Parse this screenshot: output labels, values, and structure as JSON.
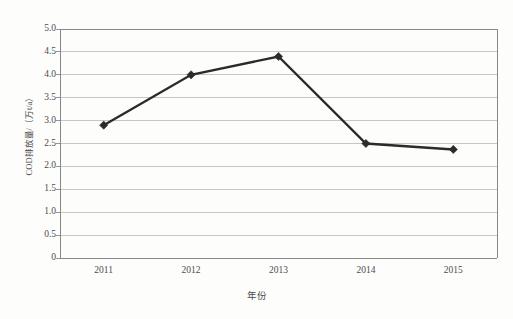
{
  "chart_data": {
    "type": "line",
    "title": "",
    "xlabel": "年份",
    "ylabel": "COD排放量/（万t/a）",
    "categories": [
      "2011",
      "2012",
      "2013",
      "2014",
      "2015"
    ],
    "values": [
      2.9,
      4.0,
      4.4,
      2.5,
      2.37
    ],
    "series": [
      {
        "name": "COD排放量",
        "values": [
          2.9,
          4.0,
          4.4,
          2.5,
          2.37
        ]
      }
    ],
    "ylim": [
      0,
      5.0
    ],
    "ytick_labels": [
      "5.0",
      "4.5",
      "4.0",
      "3.5",
      "3.0",
      "2.5",
      "2.0",
      "1.5",
      "1.0",
      "0.5",
      "0"
    ],
    "ytick_values": [
      5.0,
      4.5,
      4.0,
      3.5,
      3.0,
      2.5,
      2.0,
      1.5,
      1.0,
      0.5,
      0
    ],
    "grid": true,
    "grid_axis": "y",
    "legend": "none",
    "marker": "diamond",
    "line_color": "#2b2b2b",
    "grid_color": "#bfbfbf",
    "axis_color": "#888888",
    "background_color": "#fdfdfc"
  },
  "axis": {
    "y_title": "COD排放量/（万t/a）",
    "x_title": "年份"
  },
  "caption": {
    "text": ""
  }
}
